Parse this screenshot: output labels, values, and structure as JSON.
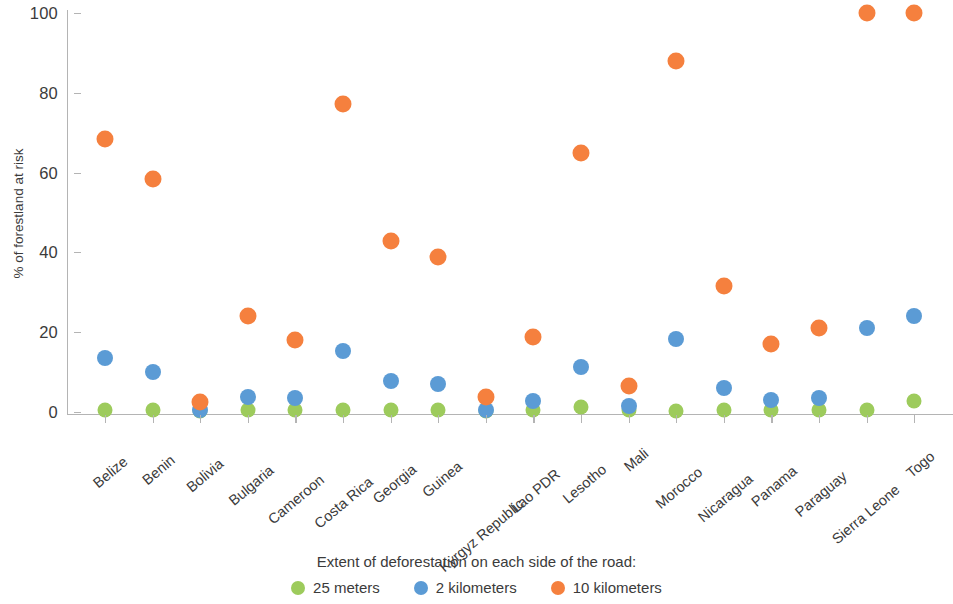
{
  "chart_data": {
    "type": "scatter",
    "title": "",
    "xlabel": "",
    "ylabel": "% of forestland at risk",
    "ylim": [
      0,
      100
    ],
    "yticks": [
      0,
      20,
      40,
      60,
      80,
      100
    ],
    "grid": false,
    "legend_position": "bottom",
    "legend_title": "Extent of deforestation on each side of the road:",
    "categories": [
      "Belize",
      "Benin",
      "Bolivia",
      "Bulgaria",
      "Cameroon",
      "Costa Rica",
      "Georgia",
      "Guinea",
      "Kyrgyz Republic",
      "Lao PDR",
      "Lesotho",
      "Mali",
      "Morocco",
      "Nicaragua",
      "Panama",
      "Paraguay",
      "Sierra Leone",
      "Togo"
    ],
    "series": [
      {
        "name": "25 meters",
        "color": "#9DCB5C",
        "values": [
          0.6,
          0.5,
          0.2,
          0.4,
          0.5,
          0.5,
          0.4,
          0.4,
          0.3,
          0.5,
          1.2,
          0.4,
          0.3,
          0.4,
          0.4,
          0.5,
          0.5,
          2.7
        ]
      },
      {
        "name": "2 kilometers",
        "color": "#5B9BD5",
        "values": [
          13.5,
          10.0,
          0.5,
          3.8,
          3.4,
          15.2,
          7.8,
          7.0,
          0.4,
          2.8,
          11.2,
          1.5,
          18.2,
          6.0,
          3.0,
          3.5,
          21.0,
          24.0
        ]
      },
      {
        "name": "10 kilometers",
        "color": "#F5803E",
        "values": [
          68.4,
          58.4,
          2.6,
          24.0,
          18.0,
          77.2,
          42.8,
          38.8,
          3.8,
          18.8,
          65.0,
          6.6,
          88.0,
          31.6,
          17.0,
          21.0,
          100.0,
          100.0
        ]
      }
    ]
  },
  "legend": {
    "title": "Extent of deforestation on each side of the road:",
    "items": [
      {
        "label": "25 meters",
        "color": "#9DCB5C"
      },
      {
        "label": "2 kilometers",
        "color": "#5B9BD5"
      },
      {
        "label": "10 kilometers",
        "color": "#F5803E"
      }
    ]
  },
  "axes": {
    "y_title": "% of forestland at risk",
    "y_tick_labels": [
      "100",
      "80",
      "60",
      "40",
      "20",
      "0"
    ]
  }
}
